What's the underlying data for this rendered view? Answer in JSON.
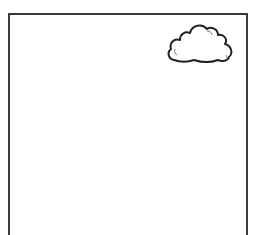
{
  "scene": {
    "panel": {
      "border_color": "#3a3a3a",
      "background": "#ffffff"
    },
    "cloud": {
      "icon": "cloud-icon",
      "stroke": "#222222",
      "fill": "#ffffff"
    }
  }
}
